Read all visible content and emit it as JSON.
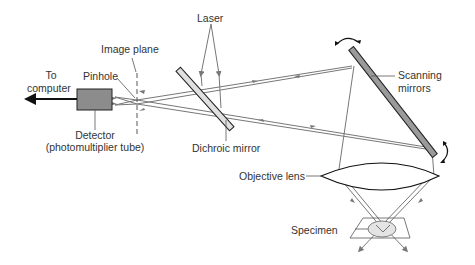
{
  "labels": {
    "laser": "Laser",
    "image_plane": "Image plane",
    "to_computer_1": "To",
    "to_computer_2": "computer",
    "pinhole": "Pinhole",
    "detector_1": "Detector",
    "detector_2": "(photomultiplier tube)",
    "dichroic_mirror": "Dichroic mirror",
    "scanning_mirrors_1": "Scanning",
    "scanning_mirrors_2": "mirrors",
    "objective_lens": "Objective lens",
    "specimen": "Specimen"
  },
  "colors": {
    "ray": "#777777",
    "mirror_fill": "#9a9a9a",
    "dichroic_fill": "#e0e0e0",
    "detector_fill": "#8c8c8c",
    "specimen_fill": "#e4e4e4",
    "outline": "#222222"
  }
}
